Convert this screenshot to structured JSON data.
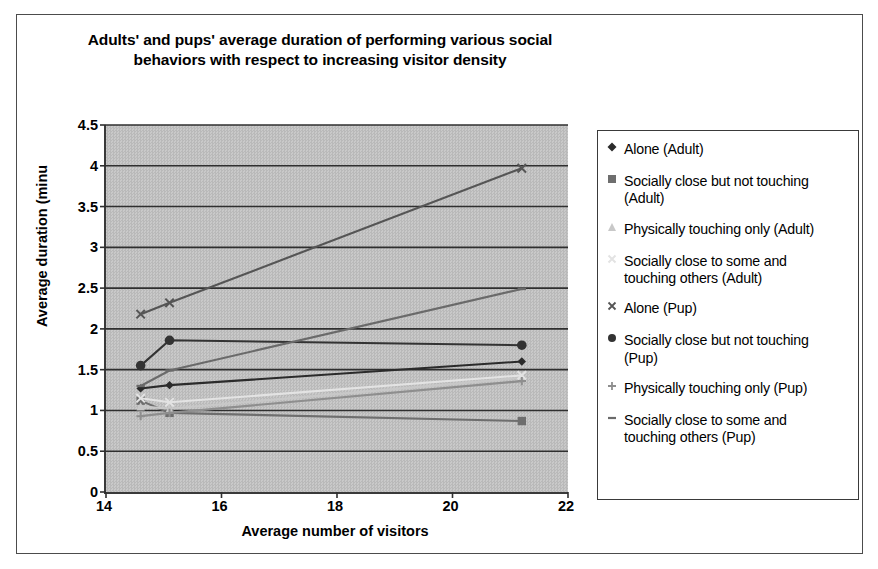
{
  "chart_data": {
    "type": "line",
    "title": "Adults' and pups' average duration of performing various social behaviors with respect to increasing visitor density",
    "title_lines": [
      "Adults' and pups' average duration of performing various social",
      "behaviors with respect to increasing visitor density"
    ],
    "xlabel": "Average number of visitors",
    "ylabel": "Average duration (minu",
    "xlim": [
      14,
      22
    ],
    "ylim": [
      0,
      4.5
    ],
    "xticks": [
      14,
      16,
      18,
      20,
      22
    ],
    "yticks": [
      0,
      0.5,
      1,
      1.5,
      2,
      2.5,
      3,
      3.5,
      4,
      4.5
    ],
    "grid": "horizontal",
    "legend_position": "right",
    "plot_background": "#c2c2c2",
    "x": [
      14.6,
      15.1,
      21.2
    ],
    "series": [
      {
        "name": "Alone (Adult)",
        "marker": "diamond",
        "color": "#2b2b2b",
        "values": [
          1.27,
          1.31,
          1.6
        ]
      },
      {
        "name": "Socially close but not touching (Adult)",
        "marker": "square",
        "color": "#6e6e6e",
        "values": [
          1.12,
          0.97,
          0.87
        ]
      },
      {
        "name": "Physically touching only (Adult)",
        "marker": "triangle",
        "color": "#c8c8c8",
        "values": [
          1.05,
          1.02,
          1.4
        ]
      },
      {
        "name": "Socially close to some and touching others (Adult)",
        "marker": "cross-x-light",
        "color": "#e3e3e3",
        "values": [
          1.15,
          1.1,
          1.43
        ]
      },
      {
        "name": "Alone (Pup)",
        "marker": "x",
        "color": "#555555",
        "values": [
          2.18,
          2.32,
          3.97
        ]
      },
      {
        "name": "Socially close but not touching (Pup)",
        "marker": "filled-circle",
        "color": "#333333",
        "values": [
          1.55,
          1.86,
          1.8
        ]
      },
      {
        "name": "Physically touching only (Pup)",
        "marker": "plus",
        "color": "#8e8e8e",
        "values": [
          0.93,
          0.97,
          1.36
        ]
      },
      {
        "name": "Socially close to some and touching others (Pup)",
        "marker": "dash",
        "color": "#6a6a6a",
        "values": [
          1.3,
          1.49,
          2.49
        ]
      }
    ]
  },
  "legend": {
    "items": [
      {
        "label": "Alone (Adult)",
        "marker": "diamond-icon"
      },
      {
        "label": "Socially close but not touching\n(Adult)",
        "marker": "square-icon"
      },
      {
        "label": "Physically touching only (Adult)",
        "marker": "triangle-icon"
      },
      {
        "label": "Socially close to some and\ntouching others (Adult)",
        "marker": "cross-light-icon"
      },
      {
        "label": "Alone (Pup)",
        "marker": "x-icon"
      },
      {
        "label": "Socially close but not touching\n(Pup)",
        "marker": "circle-icon"
      },
      {
        "label": "Physically touching only (Pup)",
        "marker": "plus-icon"
      },
      {
        "label": "Socially close to some and\ntouching others (Pup)",
        "marker": "dash-icon"
      }
    ]
  }
}
